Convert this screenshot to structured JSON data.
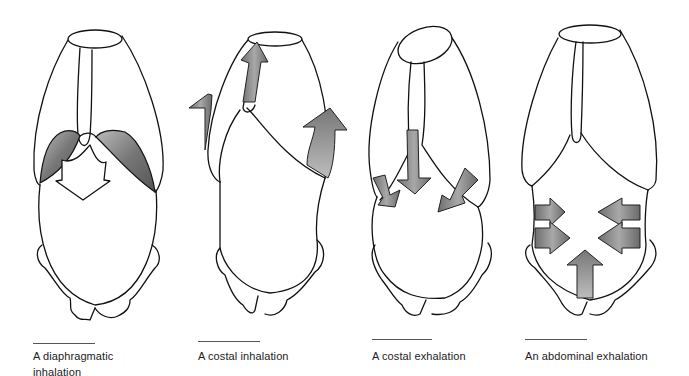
{
  "figure": {
    "panels": [
      {
        "id": "diaphragmatic-inhalation",
        "caption": "A diaphragmatic inhalation"
      },
      {
        "id": "costal-inhalation",
        "caption": "A costal inhalation"
      },
      {
        "id": "costal-exhalation",
        "caption": "A costal exhalation"
      },
      {
        "id": "abdominal-exhalation",
        "caption": "An abdominal exhalation"
      }
    ],
    "colors": {
      "outline": "#111111",
      "arrow_fill": "#8a8a8a",
      "muscle_fill": "#7a7a7a",
      "background": "#ffffff"
    }
  }
}
